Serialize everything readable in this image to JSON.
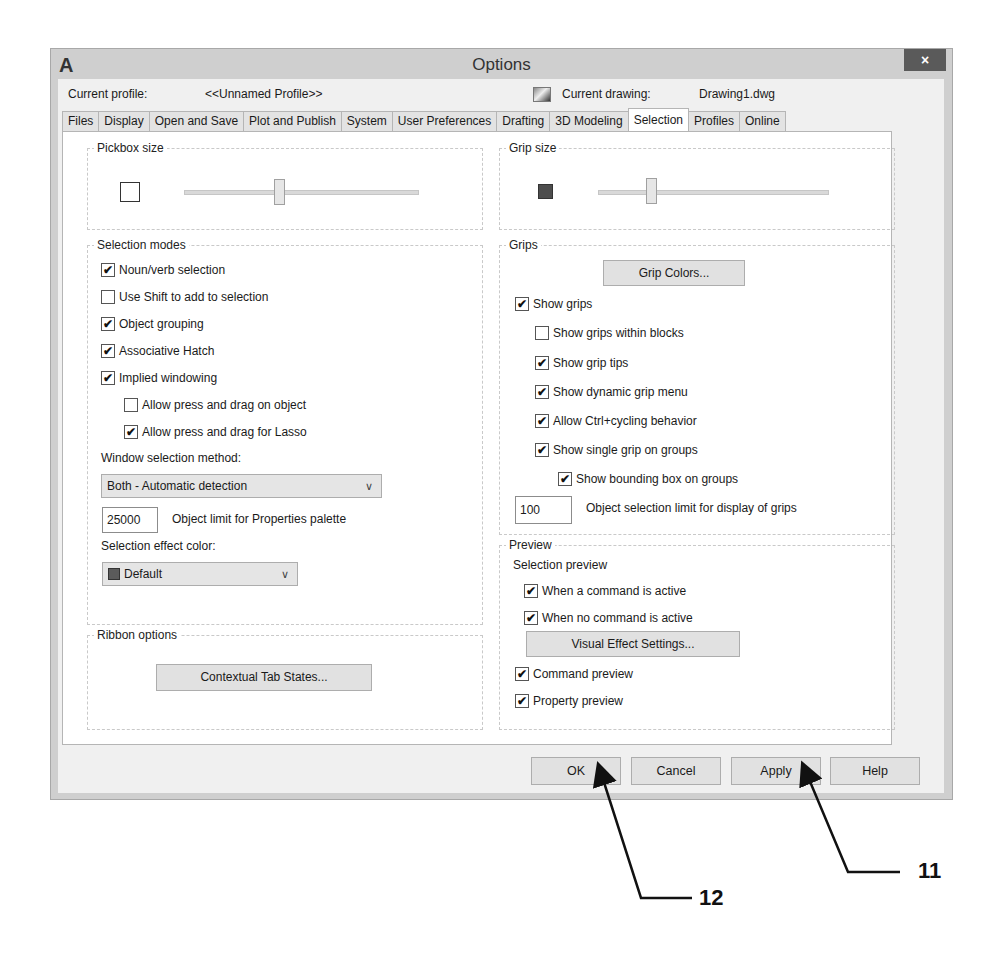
{
  "window": {
    "title": "Options",
    "app_icon": "A",
    "close_icon": "×"
  },
  "profile": {
    "current_profile_label": "Current profile:",
    "current_profile_value": "<<Unnamed Profile>>",
    "current_drawing_label": "Current drawing:",
    "current_drawing_value": "Drawing1.dwg",
    "drawing_icon": "drawing-file-icon"
  },
  "tabs": [
    {
      "label": "Files",
      "active": false
    },
    {
      "label": "Display",
      "active": false
    },
    {
      "label": "Open and Save",
      "active": false
    },
    {
      "label": "Plot and Publish",
      "active": false
    },
    {
      "label": "System",
      "active": false
    },
    {
      "label": "User Preferences",
      "active": false
    },
    {
      "label": "Drafting",
      "active": false
    },
    {
      "label": "3D Modeling",
      "active": false
    },
    {
      "label": "Selection",
      "active": true
    },
    {
      "label": "Profiles",
      "active": false
    },
    {
      "label": "Online",
      "active": false
    }
  ],
  "pickbox": {
    "label": "Pickbox size",
    "slider_position_pct": 39
  },
  "grip_size": {
    "label": "Grip size",
    "swatch_color": "#4d4d4d",
    "slider_position_pct": 22
  },
  "selection_modes": {
    "label": "Selection modes",
    "checkboxes": [
      {
        "label": "Noun/verb selection",
        "checked": true
      },
      {
        "label": "Use Shift to add to selection",
        "checked": false
      },
      {
        "label": "Object grouping",
        "checked": true
      },
      {
        "label": "Associative Hatch",
        "checked": true
      },
      {
        "label": "Implied windowing",
        "checked": true
      },
      {
        "label": "Allow press and drag on object",
        "checked": false
      },
      {
        "label": "Allow press and drag for Lasso",
        "checked": true
      }
    ],
    "window_method_label": "Window selection method:",
    "window_method_value": "Both - Automatic detection",
    "object_limit_value": "25000",
    "object_limit_label": "Object limit for Properties palette",
    "effect_color_label": "Selection effect color:",
    "effect_color_value": "Default",
    "effect_color_swatch": "#5b5b5b"
  },
  "ribbon": {
    "label": "Ribbon options",
    "button": "Contextual Tab States..."
  },
  "grips": {
    "label": "Grips",
    "grip_colors_button": "Grip Colors...",
    "checkboxes": [
      {
        "label": "Show grips",
        "checked": true
      },
      {
        "label": "Show grips within blocks",
        "checked": false
      },
      {
        "label": "Show grip tips",
        "checked": true
      },
      {
        "label": "Show dynamic grip menu",
        "checked": true
      },
      {
        "label": "Allow Ctrl+cycling behavior",
        "checked": true
      },
      {
        "label": "Show single grip on groups",
        "checked": true
      },
      {
        "label": "Show bounding box on groups",
        "checked": true
      }
    ],
    "limit_value": "100",
    "limit_label": "Object selection limit for display of grips"
  },
  "preview": {
    "label": "Preview",
    "selection_preview_label": "Selection preview",
    "checkboxes": [
      {
        "label": "When a command is active",
        "checked": true
      },
      {
        "label": "When no command is active",
        "checked": true
      },
      {
        "label": "Command preview",
        "checked": true
      },
      {
        "label": "Property preview",
        "checked": true
      }
    ],
    "visual_effect_button": "Visual Effect Settings..."
  },
  "footer": {
    "ok": "OK",
    "cancel": "Cancel",
    "apply": "Apply",
    "help": "Help"
  },
  "callouts": {
    "apply_callout": "11",
    "ok_callout": "12"
  },
  "check_glyph": "✔",
  "chevron_glyph": "∨"
}
